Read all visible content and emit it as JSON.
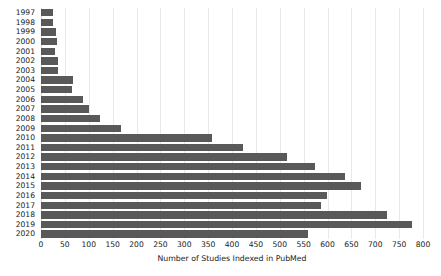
{
  "chart_data": {
    "type": "bar",
    "orientation": "horizontal",
    "title": "",
    "xlabel": "Number of Studies Indexed in PubMed",
    "ylabel": "",
    "categories": [
      "1997",
      "1998",
      "1999",
      "2000",
      "2001",
      "2002",
      "2003",
      "2004",
      "2005",
      "2006",
      "2007",
      "2008",
      "2009",
      "2010",
      "2011",
      "2012",
      "2013",
      "2014",
      "2015",
      "2016",
      "2017",
      "2018",
      "2019",
      "2020"
    ],
    "values": [
      25,
      25,
      31,
      34,
      29,
      36,
      36,
      67,
      65,
      88,
      100,
      124,
      168,
      358,
      423,
      515,
      574,
      637,
      670,
      599,
      587,
      725,
      777,
      559
    ],
    "xlim": [
      0,
      800
    ],
    "xticks": [
      0,
      50,
      100,
      150,
      200,
      250,
      300,
      350,
      400,
      450,
      500,
      550,
      600,
      650,
      700,
      750,
      800
    ],
    "xtick_labels": [
      "0",
      "50",
      "100",
      "150",
      "200",
      "250",
      "300",
      "350",
      "400",
      "450",
      "500",
      "550",
      "600",
      "650",
      "700",
      "750",
      "800"
    ],
    "grid": true,
    "grid_axis": "x",
    "legend": null,
    "bar_color": "#595959",
    "grid_color": "#e9e9e9",
    "background_color": "#ffffff"
  },
  "watermark": {
    "text": "PubMed"
  }
}
